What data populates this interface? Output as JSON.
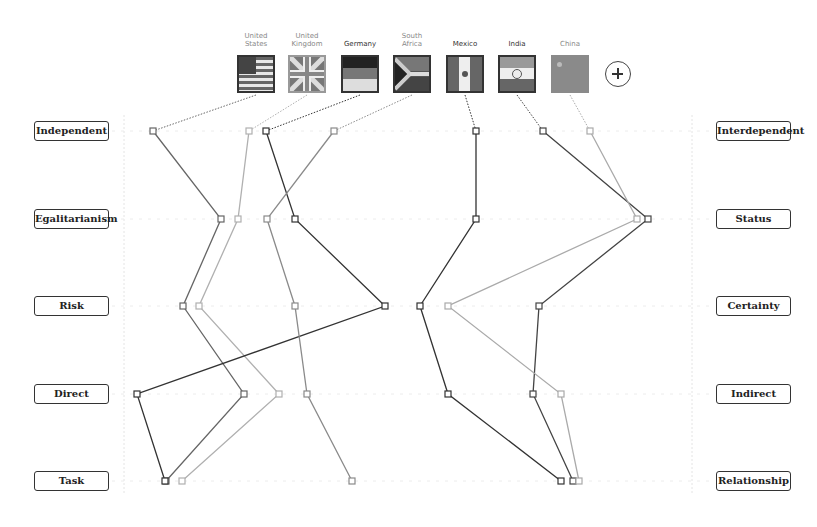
{
  "countries": [
    {
      "name_line1": "United",
      "name_line2": "States",
      "flag_icon": "us-flag-icon"
    },
    {
      "name_line1": "United",
      "name_line2": "Kingdom",
      "flag_icon": "uk-flag-icon"
    },
    {
      "name_line1": "",
      "name_line2": "Germany",
      "flag_icon": "germany-flag-icon"
    },
    {
      "name_line1": "South",
      "name_line2": "Africa",
      "flag_icon": "south-africa-flag-icon"
    },
    {
      "name_line1": "",
      "name_line2": "Mexico",
      "flag_icon": "mexico-flag-icon"
    },
    {
      "name_line1": "",
      "name_line2": "India",
      "flag_icon": "india-flag-icon"
    },
    {
      "name_line1": "",
      "name_line2": "China",
      "flag_icon": "china-flag-icon"
    }
  ],
  "add_button": {
    "icon": "plus-icon",
    "label": "+"
  },
  "dimensions": {
    "left": [
      "Independent",
      "Egalitarianism",
      "Risk",
      "Direct",
      "Task"
    ],
    "right": [
      "Interdependent",
      "Status",
      "Certainty",
      "Indirect",
      "Relationship"
    ]
  },
  "chart_data": {
    "type": "line",
    "title": "",
    "orientation": "vertical parallel-coordinate profile",
    "categories": [
      "Independent / Interdependent",
      "Egalitarianism / Status",
      "Risk / Certainty",
      "Direct / Indirect",
      "Task / Relationship"
    ],
    "xlabel_left_pole": "left-side dimension",
    "xlabel_right_pole": "right-side dimension",
    "scale_note": "x position 0 = fully left pole, 100 = fully right pole (estimated from pixel positions)",
    "xlim": [
      0,
      100
    ],
    "grid": true,
    "series": [
      {
        "name": "United States",
        "color": "#555555",
        "values": [
          3,
          16,
          9,
          21,
          6
        ]
      },
      {
        "name": "United Kingdom",
        "color": "#aaaaaa",
        "values": [
          21,
          19,
          12,
          27,
          9
        ]
      },
      {
        "name": "Germany",
        "color": "#333333",
        "values": [
          25,
          30,
          47,
          0,
          6
        ]
      },
      {
        "name": "South Africa",
        "color": "#888888",
        "values": [
          38,
          25,
          30,
          33,
          41
        ]
      },
      {
        "name": "Mexico",
        "color": "#333333",
        "values": [
          65,
          65,
          55,
          60,
          81
        ]
      },
      {
        "name": "India",
        "color": "#444444",
        "values": [
          78,
          98,
          77,
          76,
          84
        ]
      },
      {
        "name": "China",
        "color": "#aaaaaa",
        "values": [
          87,
          96,
          60,
          81,
          85
        ]
      }
    ]
  },
  "plot_pixels": {
    "row_y": [
      131,
      219,
      306,
      394,
      481
    ],
    "lines": [
      {
        "country": "United States",
        "xs": [
          153,
          221,
          183,
          244,
          166
        ],
        "stroke": "#666666",
        "flag_x": 256
      },
      {
        "country": "United Kingdom",
        "xs": [
          249,
          238,
          199,
          279,
          182
        ],
        "stroke": "#b0b0b0",
        "flag_x": 307
      },
      {
        "country": "Germany",
        "xs": [
          266,
          295,
          385,
          137,
          165
        ],
        "stroke": "#333333",
        "flag_x": 360
      },
      {
        "country": "South Africa",
        "xs": [
          334,
          267,
          295,
          307,
          352
        ],
        "stroke": "#8a8a8a",
        "flag_x": 412
      },
      {
        "country": "Mexico",
        "xs": [
          476,
          476,
          420,
          448,
          561
        ],
        "stroke": "#333333",
        "flag_x": 465
      },
      {
        "country": "India",
        "xs": [
          543,
          648,
          539,
          533,
          573
        ],
        "stroke": "#444444",
        "flag_x": 517
      },
      {
        "country": "China",
        "xs": [
          590,
          637,
          448,
          561,
          579
        ],
        "stroke": "#aaaaaa",
        "flag_x": 570
      }
    ]
  }
}
